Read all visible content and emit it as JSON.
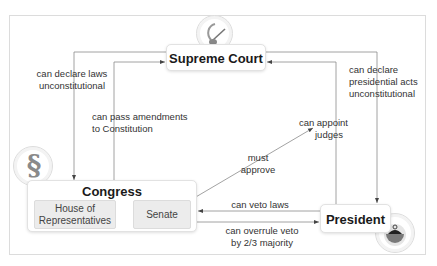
{
  "diagram": {
    "nodes": {
      "supreme_court": {
        "label": "Supreme Court",
        "icon": "gavel-icon"
      },
      "congress": {
        "label": "Congress",
        "icon": "section-sign-icon",
        "icon_glyph": "§",
        "chambers": [
          {
            "label_line1": "House of",
            "label_line2": "Representatives"
          },
          {
            "label": "Senate"
          }
        ]
      },
      "president": {
        "label": "President",
        "icon": "bell-jar-icon"
      }
    },
    "edges": [
      {
        "from": "supreme_court",
        "to": "congress",
        "line1": "can declare laws",
        "line2": "unconstitutional"
      },
      {
        "from": "congress",
        "to": "supreme_court",
        "line1": "can pass amendments",
        "line2": "to Constitution"
      },
      {
        "from": "supreme_court",
        "to": "president",
        "line1": "can declare",
        "line2": "presidential acts",
        "line3": "unconstitutional"
      },
      {
        "from": "president",
        "to": "supreme_court",
        "line1": "can appoint",
        "line2": "judges"
      },
      {
        "from": "senate",
        "to": "judges",
        "line1": "must",
        "line2": "approve"
      },
      {
        "from": "president",
        "to": "senate",
        "line1": "can veto laws"
      },
      {
        "from": "congress",
        "to": "president",
        "line1": "can overrule veto",
        "line2": "by 2/3 majority"
      }
    ],
    "colors": {
      "line": "#8a8a8a",
      "node_border": "#e2e2e2",
      "chamber_fill": "#ececec",
      "frame_border": "#dcdcdc"
    }
  }
}
